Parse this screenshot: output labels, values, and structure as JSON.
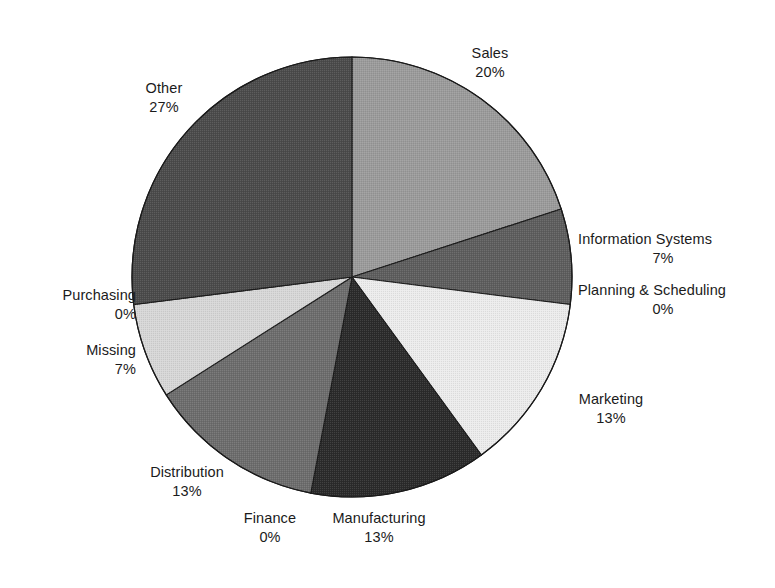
{
  "chart_data": {
    "type": "pie",
    "title": "",
    "subtitle": "",
    "xlabel": "",
    "ylabel": "",
    "legend_position": "none",
    "grid": false,
    "label_format": "name-above-percent",
    "start_angle_deg": 0,
    "direction": "clockwise",
    "categories": [
      "Sales",
      "Information Systems",
      "Planning & Scheduling",
      "Marketing",
      "Manufacturing",
      "Finance",
      "Distribution",
      "Missing",
      "Purchasing",
      "Other"
    ],
    "values": [
      20,
      7,
      0,
      13,
      13,
      0,
      13,
      7,
      0,
      27
    ],
    "value_labels": [
      "20%",
      "7%",
      "0%",
      "13%",
      "13%",
      "0%",
      "13%",
      "7%",
      "0%",
      "27%"
    ],
    "units": "percent",
    "slices": [
      {
        "name": "Sales",
        "value": 20,
        "value_label": "20%",
        "color": "#9b9b9b"
      },
      {
        "name": "Information Systems",
        "value": 7,
        "value_label": "7%",
        "color": "#5e5e5e"
      },
      {
        "name": "Planning & Scheduling",
        "value": 0,
        "value_label": "0%",
        "color": "#c8c8c8"
      },
      {
        "name": "Marketing",
        "value": 13,
        "value_label": "13%",
        "color": "#ececec"
      },
      {
        "name": "Manufacturing",
        "value": 13,
        "value_label": "13%",
        "color": "#2b2b2b"
      },
      {
        "name": "Finance",
        "value": 0,
        "value_label": "0%",
        "color": "#707070"
      },
      {
        "name": "Distribution",
        "value": 13,
        "value_label": "13%",
        "color": "#6d6d6d"
      },
      {
        "name": "Missing",
        "value": 7,
        "value_label": "7%",
        "color": "#d7d7d7"
      },
      {
        "name": "Purchasing",
        "value": 0,
        "value_label": "0%",
        "color": "#8a8a8a"
      },
      {
        "name": "Other",
        "value": 27,
        "value_label": "27%",
        "color": "#4b4b4b"
      }
    ],
    "outline_color": "#1a1a1a",
    "background_color": "#ffffff"
  },
  "labels": {
    "sales": {
      "name": "Sales",
      "value": "20%"
    },
    "information": {
      "name": "Information Systems",
      "value": "7%"
    },
    "planning": {
      "name": "Planning & Scheduling",
      "value": "0%"
    },
    "marketing": {
      "name": "Marketing",
      "value": "13%"
    },
    "manufacturing": {
      "name": "Manufacturing",
      "value": "13%"
    },
    "finance": {
      "name": "Finance",
      "value": "0%"
    },
    "distribution": {
      "name": "Distribution",
      "value": "13%"
    },
    "missing": {
      "name": "Missing",
      "value": "7%"
    },
    "purchasing": {
      "name": "Purchasing",
      "value": "0%"
    },
    "other": {
      "name": "Other",
      "value": "27%"
    }
  }
}
